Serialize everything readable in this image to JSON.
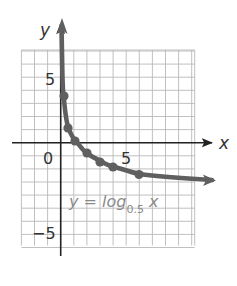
{
  "chart_data": {
    "type": "line",
    "title": "",
    "xlabel": "x",
    "ylabel": "y",
    "xlim": [
      -3,
      10
    ],
    "ylim": [
      -8,
      7
    ],
    "grid": true,
    "tick_labels": {
      "origin": "0",
      "x": [
        {
          "value": 5,
          "label": "5"
        }
      ],
      "y": [
        {
          "value": 5,
          "label": "5"
        },
        {
          "value": -5,
          "label": "−5"
        }
      ]
    },
    "series": [
      {
        "name": "y = log0.5 x",
        "color": "#5f5f5f",
        "arrow_ends": [
          "up (x→0+)",
          "right (x→∞)"
        ],
        "points": [
          {
            "x": 0.125,
            "y": 3
          },
          {
            "x": 0.5,
            "y": 1
          },
          {
            "x": 1,
            "y": 0
          },
          {
            "x": 2,
            "y": -1
          },
          {
            "x": 3,
            "y": -1.58
          },
          {
            "x": 4,
            "y": -2
          },
          {
            "x": 6,
            "y": -2.58
          }
        ]
      }
    ],
    "annotations": [
      {
        "text": "y = log0.5 x",
        "position": "below curve, right of y-axis"
      }
    ]
  },
  "labels": {
    "x_axis": "x",
    "y_axis": "y",
    "origin": "0",
    "x_tick_5": "5",
    "y_tick_5": "5",
    "y_tick_neg5": "−5",
    "equation_main": "y = log",
    "equation_base": "0.5",
    "equation_var": "x"
  },
  "colors": {
    "curve": "#5f5f5f",
    "grid": "#b9b9b9",
    "axis": "#222222",
    "equation": "#8a8a8a"
  }
}
